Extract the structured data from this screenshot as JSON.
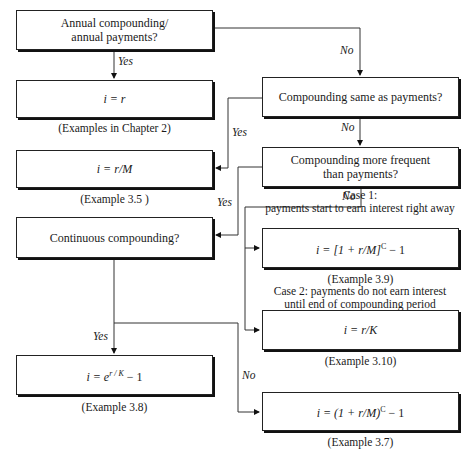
{
  "top_fragment": "payments?",
  "nodes": {
    "annual": {
      "text_line1": "Annual compounding/",
      "text_line2": "annual payments?"
    },
    "i_eq_r": {
      "formula": "i = r",
      "caption": "(Examples in Chapter 2)"
    },
    "same": {
      "text": "Compounding same as payments?"
    },
    "i_eq_r_over_m": {
      "formula": "i = r/M",
      "caption": "(Example 3.5 )"
    },
    "more_freq": {
      "text_line1": "Compounding more frequent",
      "text_line2": "than payments?"
    },
    "continuous": {
      "text": "Continuous compounding?"
    },
    "case1": {
      "note_line1": "Case 1:",
      "note_line2": "payments start to earn interest right away",
      "formula_base": "i = [1 + r/M]",
      "formula_exp": "C",
      "formula_tail": " − 1",
      "caption": "(Example 3.9)"
    },
    "case2": {
      "note_line1": "Case 2: payments do not earn interest",
      "note_line2": "until end of compounding period",
      "formula": "i = r/K",
      "caption": "(Example 3.10)"
    },
    "cont_formula": {
      "formula_base": "i = e",
      "formula_exp": "r / K",
      "formula_tail": " − 1",
      "caption": "(Example 3.8)"
    },
    "discrete": {
      "formula_base": "i = (1 + r/M)",
      "formula_exp": "C",
      "formula_tail": " − 1",
      "caption": "(Example 3.7)"
    }
  },
  "edge_labels": {
    "annual_yes": "Yes",
    "annual_no": "No",
    "same_yes": "Yes",
    "same_no": "No",
    "more_yes": "Yes",
    "more_no": "No",
    "cont_yes": "Yes",
    "cont_no": "No"
  }
}
